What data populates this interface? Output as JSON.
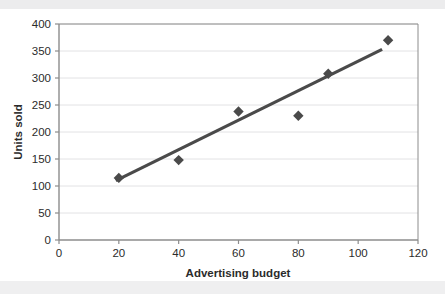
{
  "chart_data": {
    "type": "scatter",
    "title": "",
    "xlabel": "Advertising budget",
    "ylabel": "Units sold",
    "xlim": [
      0,
      120
    ],
    "ylim": [
      0,
      400
    ],
    "xticks": [
      0,
      20,
      40,
      60,
      80,
      100,
      120
    ],
    "yticks": [
      0,
      50,
      100,
      150,
      200,
      250,
      300,
      350,
      400
    ],
    "grid": "horizontal",
    "legend": "none",
    "x": [
      20,
      40,
      60,
      80,
      90,
      110
    ],
    "y": [
      115,
      148,
      238,
      230,
      308,
      370
    ],
    "points": [
      {
        "x": 20,
        "y": 115
      },
      {
        "x": 40,
        "y": 148
      },
      {
        "x": 60,
        "y": 238
      },
      {
        "x": 80,
        "y": 230
      },
      {
        "x": 90,
        "y": 308
      },
      {
        "x": 110,
        "y": 370
      }
    ],
    "trendline": {
      "type": "linear",
      "x_start": 19,
      "y_start": 110,
      "x_end": 108,
      "y_end": 353
    },
    "marker": "diamond",
    "marker_color": "#4a4a4a",
    "line_color": "#4a4a4a",
    "axis_color": "#8c8c8c",
    "grid_color": "#e2e2e4",
    "background_color": "#ffffff"
  },
  "axis": {
    "x_tick_labels": [
      "0",
      "20",
      "40",
      "60",
      "80",
      "100",
      "120"
    ],
    "y_tick_labels": [
      "0",
      "50",
      "100",
      "150",
      "200",
      "250",
      "300",
      "350",
      "400"
    ],
    "x_title": "Advertising budget",
    "y_title": "Units sold"
  }
}
